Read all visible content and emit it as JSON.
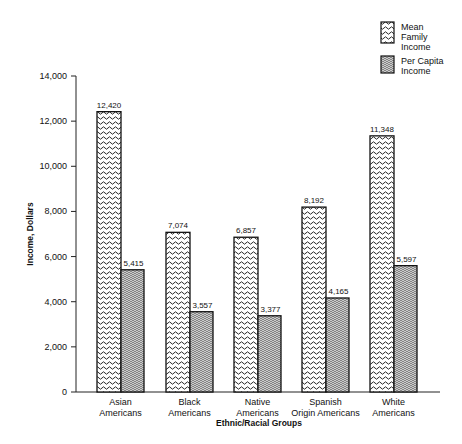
{
  "chart_data": {
    "type": "bar",
    "title": "",
    "xlabel": "Ethnic/Racial Groups",
    "ylabel": "Income, Dollars",
    "ylim": [
      0,
      14000
    ],
    "yticks": [
      0,
      2000,
      4000,
      6000,
      8000,
      10000,
      12000,
      14000
    ],
    "ytick_labels": [
      "0",
      "2,000",
      "4,000",
      "6,000",
      "8,000",
      "10,000",
      "12,000",
      "14,000"
    ],
    "grid": false,
    "legend_position": "top-right",
    "categories": [
      [
        "Asian",
        "Americans"
      ],
      [
        "Black",
        "Americans"
      ],
      [
        "Native",
        "Americans"
      ],
      [
        "Spanish",
        "Origin  Americans"
      ],
      [
        "White",
        "Americans"
      ]
    ],
    "series": [
      {
        "name": "Mean Family Income",
        "legend_lines": [
          "Mean",
          "Family",
          "Income"
        ],
        "pattern": "wave",
        "values": [
          12420,
          7074,
          6857,
          8192,
          11348
        ],
        "labels": [
          "12,420",
          "7,074",
          "6,857",
          "8,192",
          "11,348"
        ]
      },
      {
        "name": "Per Capita Income",
        "legend_lines": [
          "Per Capita",
          "Income"
        ],
        "pattern": "fine-lines",
        "values": [
          5415,
          3557,
          3377,
          4165,
          5597
        ],
        "labels": [
          "5,415",
          "3,557",
          "3,377",
          "4,165",
          "5,597"
        ]
      }
    ]
  }
}
